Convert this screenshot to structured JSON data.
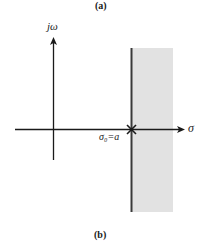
{
  "captions": {
    "top": "(a)",
    "bottom": "(b)"
  },
  "axes": {
    "vertical_label": "jω",
    "horizontal_label": "σ",
    "point_label": "σ₀=a"
  },
  "colors": {
    "axis": "#1a1a1a",
    "region": "#e2e2e2",
    "boundary": "#3a3a3a"
  }
}
